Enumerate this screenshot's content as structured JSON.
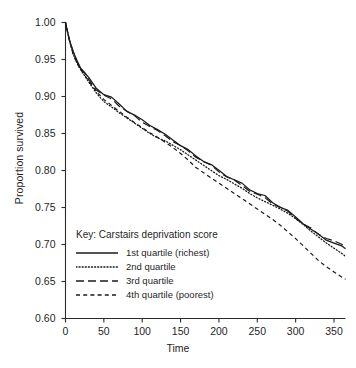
{
  "chart_data": {
    "type": "line",
    "title": "",
    "xlabel": "Time",
    "ylabel": "Proportion survived",
    "xlim": [
      0,
      365
    ],
    "ylim": [
      0.6,
      1.0
    ],
    "xticks": [
      0,
      50,
      100,
      150,
      200,
      250,
      300,
      350
    ],
    "yticks": [
      "1.00",
      "0.95",
      "0.90",
      "0.85",
      "0.80",
      "0.75",
      "0.70",
      "0.65",
      "0.60"
    ],
    "ytick_values": [
      1.0,
      0.95,
      0.9,
      0.85,
      0.8,
      0.75,
      0.7,
      0.65,
      0.6
    ],
    "grid": false,
    "legend_position": "center-left",
    "legend_title": "Key: Carstairs deprivation score",
    "series": [
      {
        "name": "1st quartile (richest)",
        "style": "solid",
        "color": "#1a1a1a",
        "x": [
          0,
          5,
          10,
          15,
          20,
          25,
          30,
          40,
          50,
          60,
          70,
          80,
          90,
          100,
          110,
          120,
          130,
          140,
          150,
          160,
          170,
          180,
          190,
          200,
          210,
          220,
          230,
          240,
          250,
          260,
          270,
          280,
          290,
          300,
          310,
          320,
          330,
          340,
          350,
          360,
          365
        ],
        "y": [
          1.0,
          0.978,
          0.96,
          0.948,
          0.939,
          0.932,
          0.925,
          0.912,
          0.903,
          0.898,
          0.89,
          0.881,
          0.874,
          0.868,
          0.862,
          0.855,
          0.848,
          0.842,
          0.834,
          0.827,
          0.82,
          0.813,
          0.807,
          0.8,
          0.793,
          0.787,
          0.782,
          0.775,
          0.769,
          0.765,
          0.757,
          0.751,
          0.745,
          0.737,
          0.729,
          0.72,
          0.713,
          0.707,
          0.702,
          0.697,
          0.695
        ]
      },
      {
        "name": "2nd quartile",
        "style": "dotted",
        "color": "#1a1a1a",
        "x": [
          0,
          5,
          10,
          15,
          20,
          25,
          30,
          40,
          50,
          60,
          70,
          80,
          90,
          100,
          110,
          120,
          130,
          140,
          150,
          160,
          170,
          180,
          190,
          200,
          210,
          220,
          230,
          240,
          250,
          260,
          270,
          280,
          290,
          300,
          310,
          320,
          330,
          340,
          350,
          360,
          365
        ],
        "y": [
          1.0,
          0.976,
          0.957,
          0.945,
          0.936,
          0.928,
          0.92,
          0.905,
          0.893,
          0.886,
          0.878,
          0.871,
          0.864,
          0.857,
          0.85,
          0.844,
          0.84,
          0.834,
          0.828,
          0.821,
          0.814,
          0.807,
          0.8,
          0.793,
          0.788,
          0.782,
          0.776,
          0.769,
          0.763,
          0.758,
          0.753,
          0.748,
          0.742,
          0.735,
          0.727,
          0.718,
          0.71,
          0.702,
          0.695,
          0.688,
          0.684
        ]
      },
      {
        "name": "3rd quartile",
        "style": "long-dash",
        "color": "#1a1a1a",
        "x": [
          0,
          5,
          10,
          15,
          20,
          25,
          30,
          40,
          50,
          60,
          70,
          80,
          90,
          100,
          110,
          120,
          130,
          140,
          150,
          160,
          170,
          180,
          190,
          200,
          210,
          220,
          230,
          240,
          250,
          260,
          270,
          280,
          290,
          300,
          310,
          320,
          330,
          340,
          350,
          360,
          365
        ],
        "y": [
          1.0,
          0.977,
          0.959,
          0.947,
          0.938,
          0.931,
          0.923,
          0.91,
          0.901,
          0.896,
          0.888,
          0.88,
          0.873,
          0.866,
          0.86,
          0.853,
          0.847,
          0.84,
          0.833,
          0.826,
          0.819,
          0.812,
          0.806,
          0.799,
          0.792,
          0.786,
          0.78,
          0.773,
          0.767,
          0.763,
          0.756,
          0.75,
          0.744,
          0.736,
          0.728,
          0.721,
          0.714,
          0.709,
          0.704,
          0.7,
          0.698
        ]
      },
      {
        "name": "4th quartile (poorest)",
        "style": "short-dash",
        "color": "#1a1a1a",
        "x": [
          0,
          5,
          10,
          15,
          20,
          25,
          30,
          40,
          50,
          60,
          70,
          80,
          90,
          100,
          110,
          120,
          130,
          140,
          150,
          160,
          170,
          180,
          190,
          200,
          210,
          220,
          230,
          240,
          250,
          260,
          270,
          280,
          290,
          300,
          310,
          320,
          330,
          340,
          350,
          360,
          365
        ],
        "y": [
          1.0,
          0.976,
          0.957,
          0.945,
          0.936,
          0.929,
          0.921,
          0.907,
          0.896,
          0.888,
          0.88,
          0.872,
          0.865,
          0.858,
          0.851,
          0.845,
          0.838,
          0.831,
          0.823,
          0.814,
          0.804,
          0.797,
          0.79,
          0.783,
          0.776,
          0.769,
          0.762,
          0.755,
          0.748,
          0.741,
          0.734,
          0.726,
          0.717,
          0.708,
          0.698,
          0.688,
          0.678,
          0.67,
          0.663,
          0.656,
          0.653
        ]
      }
    ]
  },
  "axis": {
    "x_label": "Time",
    "y_label": "Proportion survived"
  }
}
